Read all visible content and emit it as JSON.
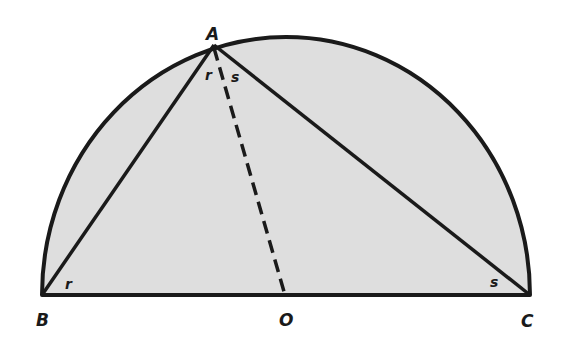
{
  "diagram": {
    "type": "semicircle-inscribed-triangle",
    "fill_color": "#dedede",
    "stroke_color": "#1a1a1a",
    "points": {
      "A": {
        "label": "A",
        "x": 214,
        "y": 45
      },
      "B": {
        "label": "B",
        "x": 42,
        "y": 295
      },
      "O": {
        "label": "O",
        "x": 285,
        "y": 295
      },
      "C": {
        "label": "C",
        "x": 530,
        "y": 295
      }
    },
    "angle_labels": {
      "A_left": "r",
      "A_right": "s",
      "B": "r",
      "C": "s"
    },
    "segments": [
      {
        "from": "A",
        "to": "B",
        "style": "solid"
      },
      {
        "from": "A",
        "to": "C",
        "style": "solid"
      },
      {
        "from": "B",
        "to": "C",
        "style": "solid"
      },
      {
        "from": "A",
        "to": "O",
        "style": "dashed"
      }
    ]
  }
}
